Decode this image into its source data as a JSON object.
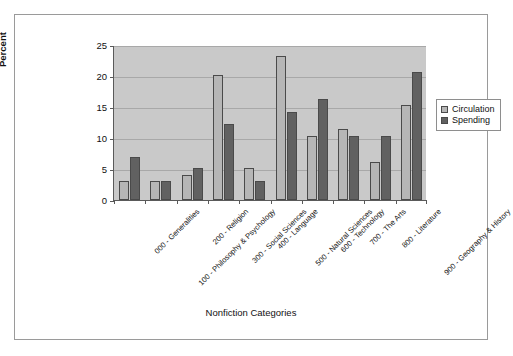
{
  "chart_data": {
    "type": "bar",
    "title": "",
    "xlabel": "Nonfiction Categories",
    "ylabel": "Percent",
    "ylim": [
      0,
      25
    ],
    "yticks": [
      0,
      5,
      10,
      15,
      20,
      25
    ],
    "grid": true,
    "legend_position": "right",
    "categories": [
      "000 - Generalities",
      "100 - Philosophy & Psychology",
      "200 - Religion",
      "300 - Social Sciences",
      "400 - Language",
      "500 - Natural Sciences",
      "600 - Technology",
      "700 - The Arts",
      "800 - Literature",
      "900 - Geography & History"
    ],
    "series": [
      {
        "name": "Circulation",
        "color": "#b6b6b6",
        "values": [
          3.0,
          3.0,
          4.0,
          20.2,
          5.2,
          23.2,
          10.3,
          11.4,
          6.2,
          15.4
        ]
      },
      {
        "name": "Spending",
        "color": "#616161",
        "values": [
          7.0,
          3.1,
          5.1,
          12.2,
          3.1,
          14.2,
          16.3,
          10.4,
          10.3,
          20.6
        ]
      }
    ]
  },
  "legend": {
    "items": [
      {
        "label": "Circulation"
      },
      {
        "label": "Spending"
      }
    ]
  }
}
